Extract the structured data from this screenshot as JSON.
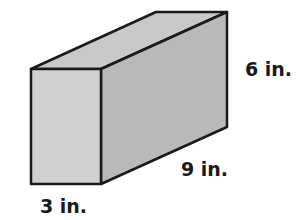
{
  "figure": {
    "shape": "rectangular-prism",
    "labels": {
      "height": "6 in.",
      "length": "9 in.",
      "width": "3 in."
    },
    "colors": {
      "front_face": "#d0d0d0",
      "side_face": "#b9b9b9",
      "top_face": "#c9c9c9",
      "edge": "#1a1a1a"
    }
  }
}
